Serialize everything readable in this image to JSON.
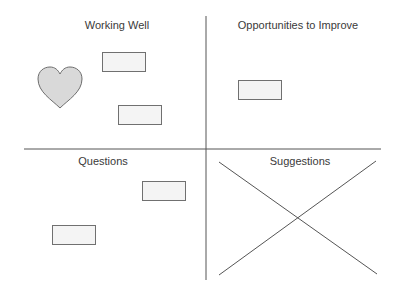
{
  "quadrants": [
    {
      "id": "working-well",
      "title": "Working Well"
    },
    {
      "id": "opportunities",
      "title": "Opportunities to Improve"
    },
    {
      "id": "questions",
      "title": "Questions"
    },
    {
      "id": "suggestions",
      "title": "Suggestions"
    }
  ],
  "shapes": {
    "heart": {
      "icon": "heart-icon",
      "fill": "#d9d9d9",
      "stroke": "#6e6e6e"
    },
    "note_fill": "#f4f4f4",
    "note_stroke": "#707070",
    "line_color": "#555555"
  }
}
